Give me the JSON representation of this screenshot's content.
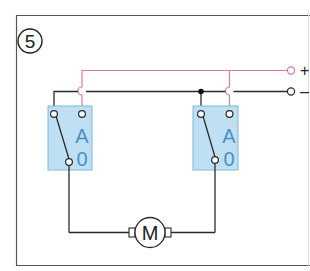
{
  "figure": {
    "number_label": "5",
    "colors": {
      "frame": "#555555",
      "wire_black": "#2a2a2a",
      "wire_pink": "#e27a93",
      "switch_fill": "#bfe0f2",
      "switch_border": "#7fb8db",
      "switch_text": "#4a90c6",
      "terminal_fill": "#ffffff"
    }
  },
  "supply": {
    "positive_label": "+",
    "negative_label": "–"
  },
  "switches": [
    {
      "id": "left",
      "label_top": "A",
      "label_bottom": "0"
    },
    {
      "id": "right",
      "label_top": "A",
      "label_bottom": "0"
    }
  ],
  "motor": {
    "label": "M"
  }
}
